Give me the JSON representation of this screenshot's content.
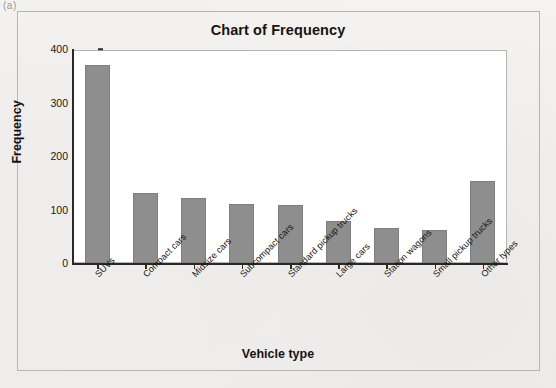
{
  "page": {
    "corner_mark": "(a)"
  },
  "chart_data": {
    "type": "bar",
    "title": "Chart of Frequency",
    "xlabel": "Vehicle type",
    "ylabel": "Frequency",
    "categories": [
      "SUVs",
      "Compact cars",
      "Midsize cars",
      "Subcompact cars",
      "Standard pickup trucks",
      "Large cars",
      "Station wagons",
      "Small pickup trucks",
      "Other types"
    ],
    "values": [
      370,
      130,
      121,
      110,
      108,
      78,
      65,
      62,
      153
    ],
    "ylim": [
      0,
      400
    ],
    "yticks": [
      0,
      100,
      200,
      300,
      400
    ],
    "ytick_labels": [
      "0",
      "100",
      "200",
      "300",
      "400"
    ],
    "grid": false,
    "legend": "none",
    "bar_color": "#8e8e8e",
    "axis_color": "#2b2826",
    "plot_background": "#ffffff",
    "page_background": "#f2f0ee"
  }
}
